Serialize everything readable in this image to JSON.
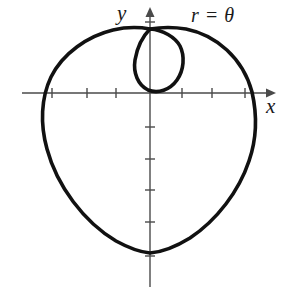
{
  "figure": {
    "background_color": "#ffffff",
    "curve_color": "#111111",
    "axis_color": "#4a4a4a",
    "label_color": "#1a1a1a"
  },
  "labels": {
    "y_axis": "y",
    "x_axis": "x",
    "equation": "r = θ"
  },
  "chart_data": {
    "type": "line",
    "title": "",
    "subtitle": "",
    "equation": "r = θ",
    "coordinate_system": "polar",
    "xlabel": "x",
    "ylabel": "y",
    "grid": false,
    "legend": [],
    "annotations": [
      {
        "text": "r = θ",
        "x_px": 191,
        "y_px": 5
      }
    ],
    "origin_px": {
      "x": 150,
      "y": 93
    },
    "axes": {
      "x_axis_px": {
        "start_x": 22,
        "end_x": 272,
        "y": 93,
        "arrow": "right"
      },
      "y_axis_px": {
        "x": 150,
        "start_y": 287,
        "end_y": 10,
        "arrow": "up"
      },
      "x_ticks_px": [
        52,
        87,
        116,
        182,
        212,
        245
      ],
      "y_ticks_px": [
        22,
        127,
        159,
        190,
        222,
        256
      ],
      "tick_half_length_px": 5
    },
    "series": [
      {
        "name": "r = θ outer branch",
        "description": "Outer heart-shaped branch of the spiral r = theta traced for theta from 0 to 2*pi, forming the large lobe.",
        "closed": true,
        "extent_px": {
          "left": 42,
          "right": 256,
          "top": 30,
          "bottom": 253
        },
        "path": "M 150 29 C 139 27 126 27 113 30 C 88 36 63 53 51 77 C 41 98 40 124 47 149 C 57 186 84 222 116 241 C 127 247 139 252 150 253 C 163 252 177 246 190 238 C 217 220 239 191 249 161 C 257 138 257 114 252 92 C 243 58 216 35 186 29 C 174 27 162 27 150 29 Z"
      },
      {
        "name": "r = θ inner loop",
        "description": "Small inner teardrop loop near the origin formed by the first part of the spiral.",
        "closed": true,
        "extent_px": {
          "left": 135,
          "right": 185,
          "top": 29,
          "bottom": 92
        },
        "path": "M 150 29 C 143 36 137 48 135 60 C 133 73 138 85 148 90 C 158 94 170 90 177 80 C 184 70 185 56 180 46 C 175 37 163 30 150 29 Z"
      }
    ]
  }
}
